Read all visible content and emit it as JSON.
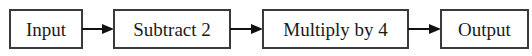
{
  "diagram": {
    "type": "flowchart",
    "direction": "left-to-right",
    "nodes": [
      {
        "id": "input",
        "label": "Input"
      },
      {
        "id": "subtract",
        "label": "Subtract 2"
      },
      {
        "id": "multiply",
        "label": "Multiply by 4"
      },
      {
        "id": "output",
        "label": "Output"
      }
    ],
    "edges": [
      {
        "from": "input",
        "to": "subtract"
      },
      {
        "from": "subtract",
        "to": "multiply"
      },
      {
        "from": "multiply",
        "to": "output"
      }
    ],
    "colors": {
      "box_border": "#3a3a3a",
      "arrow": "#111111",
      "text": "#1a1a1a",
      "background": "#ffffff"
    }
  }
}
